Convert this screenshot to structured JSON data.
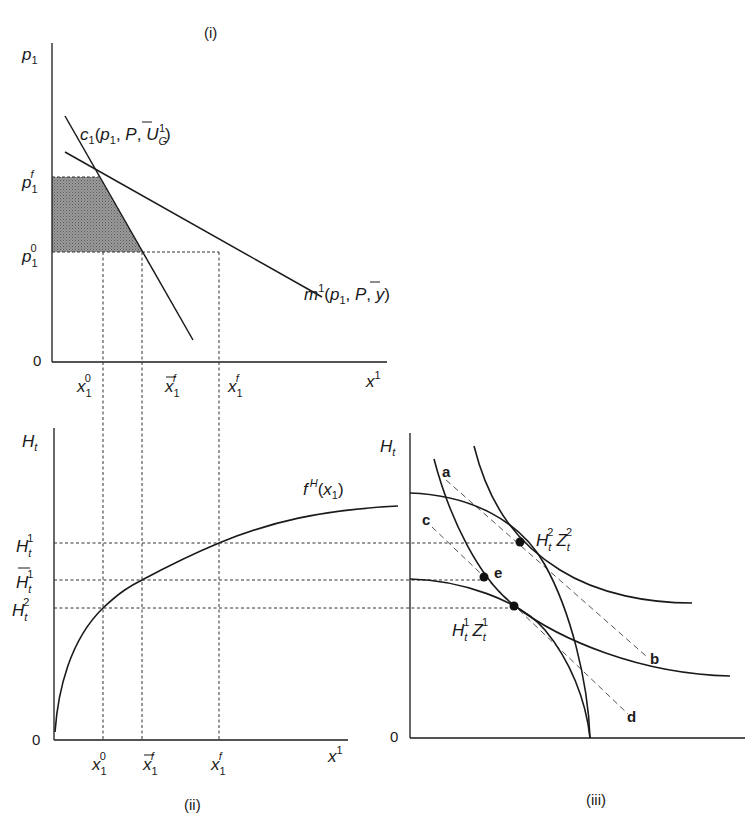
{
  "figure": {
    "panels": [
      {
        "id": "i",
        "caption": "(i)",
        "y_axis_label": "p",
        "y_axis_sub": "1",
        "x_axis_label": "x",
        "x_axis_sup": "1",
        "origin": "0",
        "y_ticks": [
          {
            "base": "p",
            "sub": "1",
            "sup": "f"
          },
          {
            "base": "p",
            "sub": "1",
            "sup": "0"
          }
        ],
        "x_ticks": [
          {
            "base": "x",
            "sub": "1",
            "sup": "0",
            "bar": false
          },
          {
            "base": "x",
            "sub": "1",
            "sup": "f",
            "bar": true
          },
          {
            "base": "x",
            "sub": "1",
            "sup": "f",
            "bar": false
          }
        ],
        "curves": {
          "compensated_demand": {
            "text_a": "c",
            "text_sub": "1",
            "text_b": "(p",
            "text_c": "1",
            "text_d": ", ",
            "text_P": "P",
            "text_e": ", U",
            "text_G": "G",
            "text_one": "1",
            "text_f": ")"
          },
          "marshallian_demand": {
            "text_a": "m",
            "text_sup": "1",
            "text_b": "(p",
            "text_c": "1",
            "text_d": ", ",
            "text_P": "P",
            "text_e": ", y)"
          }
        }
      },
      {
        "id": "ii",
        "caption": "(ii)",
        "y_axis_label": "H",
        "y_axis_sub": "t",
        "x_axis_label": "x",
        "x_axis_sup": "1",
        "origin": "0",
        "y_ticks": [
          {
            "base": "H",
            "sub": "t",
            "sup": "1",
            "bar": false
          },
          {
            "base": "H",
            "sub": "t",
            "sup": "1",
            "bar": true
          },
          {
            "base": "H",
            "sub": "t",
            "sup": "2",
            "bar": false
          }
        ],
        "x_ticks": [
          {
            "base": "x",
            "sub": "1",
            "sup": "0",
            "bar": false
          },
          {
            "base": "x",
            "sub": "1",
            "sup": "f",
            "bar": true
          },
          {
            "base": "x",
            "sub": "1",
            "sup": "f",
            "bar": false
          }
        ],
        "curve_label": {
          "base": "f",
          "sup": "H",
          "arg": " (x",
          "arg_sub": "1",
          "close": ")"
        }
      },
      {
        "id": "iii",
        "caption": "(iii)",
        "y_axis_label": "H",
        "y_axis_sub": "t",
        "origin": "0",
        "points": [
          {
            "label_H": "H",
            "H_sub": "t",
            "H_sup": "2",
            "label_Z": "Z",
            "Z_sub": "t",
            "Z_sup": "2"
          },
          {
            "label_H": "H",
            "H_sub": "t",
            "H_sup": "1",
            "label_Z": "Z",
            "Z_sub": "t",
            "Z_sup": "1"
          },
          {
            "label": "e"
          }
        ],
        "line_labels": [
          "a",
          "b",
          "c",
          "d"
        ]
      }
    ]
  },
  "colors": {
    "ink": "#1a1a1a",
    "shade": "#8a8a8a",
    "dash": "#555555"
  }
}
